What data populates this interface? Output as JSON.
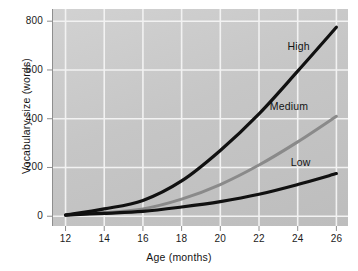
{
  "chart_data": {
    "type": "line",
    "title": "",
    "xlabel": "Age (months)",
    "ylabel": "Vocabulary size (words)",
    "x": [
      12,
      14,
      16,
      18,
      20,
      22,
      24,
      26
    ],
    "xlim": [
      11.3,
      26.6
    ],
    "ylim": [
      -40,
      850
    ],
    "xticks": [
      12,
      14,
      16,
      18,
      20,
      22,
      24,
      26
    ],
    "yticks": [
      0,
      200,
      400,
      600,
      800
    ],
    "grid": true,
    "legend_position": "inline-right",
    "series": [
      {
        "name": "High",
        "color": "#111111",
        "values": [
          5,
          30,
          65,
          145,
          270,
          420,
          595,
          775
        ]
      },
      {
        "name": "Medium",
        "color": "#8a8a8a",
        "values": [
          5,
          15,
          30,
          70,
          130,
          210,
          305,
          410
        ]
      },
      {
        "name": "Low",
        "color": "#111111",
        "values": [
          5,
          12,
          20,
          38,
          60,
          90,
          130,
          175
        ]
      }
    ]
  },
  "axes": {
    "xtick_labels": [
      "12",
      "14",
      "16",
      "18",
      "20",
      "22",
      "24",
      "26"
    ],
    "ytick_labels": [
      "0",
      "200",
      "400",
      "600",
      "800"
    ],
    "x_title": "Age (months)",
    "y_title": "Vocabulary size (words)"
  },
  "series_labels": [
    {
      "text": "High",
      "x": 24.05,
      "y": 700
    },
    {
      "text": "Medium",
      "x": 23.55,
      "y": 452
    },
    {
      "text": "Low",
      "x": 24.15,
      "y": 222
    }
  ],
  "style": {
    "plot_background_light": "#d2d2d2",
    "plot_background_dark": "#bdbdbd",
    "gridline_color": "#f2f2f2",
    "axis_color": "#8e8e8e",
    "text_color": "#141414",
    "page_background": "#ffffff"
  }
}
